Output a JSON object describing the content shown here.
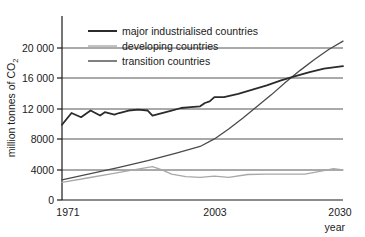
{
  "chart_data": {
    "type": "line",
    "title": "",
    "xlabel": "year",
    "ylabel": "million tonnes of CO₂",
    "ylabel_main": "million  tonnes of CO",
    "ylabel_sub": "2",
    "xlim": [
      1971,
      2030
    ],
    "ylim": [
      0,
      22000
    ],
    "grid": "horizontal",
    "legend_position": "top-left-inside",
    "x_ticks": [
      1971,
      2003,
      2030
    ],
    "x_tick_labels": [
      "1971",
      "2003",
      "2030"
    ],
    "y_ticks": [
      0,
      4000,
      8000,
      12000,
      16000,
      20000
    ],
    "y_tick_labels": [
      "0",
      "4000",
      "8000",
      "12 000",
      "16 000",
      "20 000"
    ],
    "colors": {
      "major_industrialised": "#2b2b2b",
      "developing": "#a8a8a8",
      "transition": "#4a4a4a",
      "axis": "#1a1a1a",
      "grid": "#555555",
      "background": "#ffffff"
    },
    "series": [
      {
        "name": "major industrialised countries",
        "color": "#2b2b2b",
        "x": [
          1971,
          1973,
          1975,
          1977,
          1979,
          1980,
          1982,
          1983,
          1985,
          1987,
          1989,
          1990,
          1992,
          1994,
          1996,
          1998,
          2000,
          2001,
          2002,
          2003,
          2005,
          2008,
          2011,
          2014,
          2017,
          2020,
          2023,
          2026,
          2030
        ],
        "values": [
          9000,
          10400,
          9900,
          10700,
          10100,
          10500,
          10200,
          10400,
          10700,
          10800,
          10700,
          10100,
          10400,
          10700,
          11000,
          11100,
          11200,
          11600,
          11800,
          12300,
          12300,
          12700,
          13200,
          13700,
          14300,
          14800,
          15300,
          15700,
          16000
        ]
      },
      {
        "name": "developing countries",
        "color": "#a8a8a8",
        "x": [
          1971,
          1976,
          1981,
          1986,
          1990,
          1992,
          1994,
          1997,
          2000,
          2003,
          2006,
          2010,
          2014,
          2018,
          2022,
          2026,
          2028,
          2030
        ],
        "values": [
          2100,
          2600,
          3100,
          3600,
          4000,
          3600,
          3100,
          2800,
          2700,
          2850,
          2700,
          3050,
          3100,
          3100,
          3100,
          3500,
          3750,
          3600
        ]
      },
      {
        "name": "transition countries",
        "color": "#4a4a4a",
        "x": [
          1971,
          1977,
          1983,
          1989,
          1995,
          2000,
          2003,
          2006,
          2009,
          2012,
          2015,
          2018,
          2021,
          2024,
          2027,
          2030
        ],
        "values": [
          2400,
          3150,
          3900,
          4700,
          5600,
          6400,
          7300,
          8500,
          9800,
          11200,
          12600,
          14100,
          15500,
          16800,
          18000,
          19000
        ]
      }
    ]
  },
  "legend": {
    "items": [
      {
        "label": "major industrialised countries",
        "color": "#2b2b2b",
        "width": 2
      },
      {
        "label": "developing countries",
        "color": "#a8a8a8",
        "width": 1.4
      },
      {
        "label": "transition countries",
        "color": "#4a4a4a",
        "width": 1.4
      }
    ]
  },
  "axes": {
    "y_label": "million  tonnes of CO",
    "y_label_sub": "2",
    "x_label": "year"
  }
}
